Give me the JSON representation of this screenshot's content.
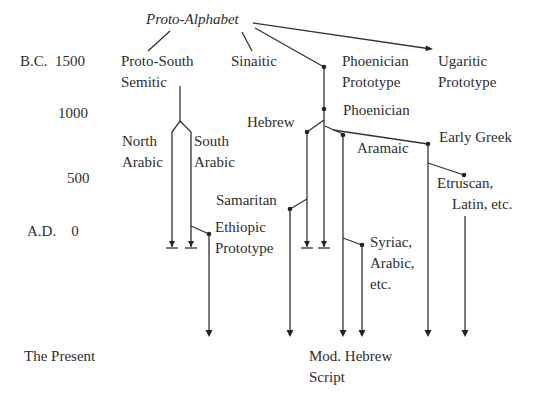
{
  "time_axis": {
    "bc_1500": "B.C.  1500",
    "y1000": "1000",
    "y500": "500",
    "ad_0": "A.D.    0",
    "present": "The Present"
  },
  "nodes": {
    "proto_alphabet": "Proto-Alphabet",
    "proto_south_semitic": "Proto-South\nSemitic",
    "sinaitic": "Sinaitic",
    "phoenician_prototype": "Phoenician\nPrototype",
    "ugaritic_prototype": "Ugaritic\nPrototype",
    "phoenician": "Phoenician",
    "hebrew": "Hebrew",
    "north_arabic": "North\nArabic",
    "south_arabic": "South\nArabic",
    "aramaic": "Aramaic",
    "early_greek": "Early Greek",
    "etruscan_latin": "Etruscan,\n    Latin, etc.",
    "samaritan": "Samaritan",
    "ethiopic_prototype": "Ethiopic\nPrototype",
    "syriac_arabic": "Syriac,\nArabic,\netc.",
    "modern_hebrew": "Mod. Hebrew\nScript"
  },
  "edges": [
    {
      "from": "Proto-Alphabet",
      "to": "Proto-South Semitic"
    },
    {
      "from": "Proto-Alphabet",
      "to": "Sinaitic"
    },
    {
      "from": "Proto-Alphabet",
      "to": "Phoenician Prototype"
    },
    {
      "from": "Proto-Alphabet",
      "to": "Ugaritic Prototype"
    },
    {
      "from": "Proto-South Semitic",
      "to": "North Arabic"
    },
    {
      "from": "Proto-South Semitic",
      "to": "South Arabic"
    },
    {
      "from": "South Arabic",
      "to": "Ethiopic Prototype"
    },
    {
      "from": "Phoenician Prototype",
      "to": "Phoenician"
    },
    {
      "from": "Phoenician",
      "to": "Hebrew"
    },
    {
      "from": "Phoenician",
      "to": "Aramaic"
    },
    {
      "from": "Phoenician",
      "to": "Early Greek"
    },
    {
      "from": "Hebrew",
      "to": "Samaritan"
    },
    {
      "from": "Aramaic",
      "to": "Syriac, Arabic, etc."
    },
    {
      "from": "Aramaic",
      "to": "Mod. Hebrew Script"
    },
    {
      "from": "Early Greek",
      "to": "Etruscan, Latin, etc."
    }
  ]
}
